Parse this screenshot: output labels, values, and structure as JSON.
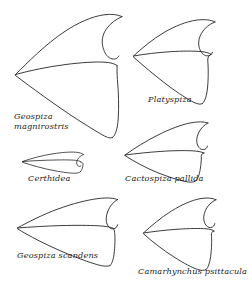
{
  "figure": {
    "kind": "scientific-line-illustration",
    "background_color": "#ffffff",
    "line_color": "#26262b",
    "width": 249,
    "height": 288
  },
  "specimens": [
    {
      "id": "geospiza-magnirostris",
      "label": "Geospiza\nmagnirostris",
      "label_lines": [
        "Geospiza",
        "magnirostris"
      ],
      "label_x": 14,
      "label_y": 112,
      "position": "top-left",
      "beak_shape": "very deep, broad, blunt crushing bill"
    },
    {
      "id": "platyspiza",
      "label": "Platyspiza",
      "label_lines": [
        "Platyspiza"
      ],
      "label_x": 148,
      "label_y": 95,
      "position": "top-right",
      "beak_shape": "deep, short, parrot-like bill"
    },
    {
      "id": "certhidea",
      "label": "Certhidea",
      "label_lines": [
        "Certhidea"
      ],
      "label_x": 28,
      "label_y": 174,
      "position": "middle-left",
      "beak_shape": "slender, fine, warbler-like bill"
    },
    {
      "id": "cactospiza-pallida",
      "label": "Cactospiza pallida",
      "label_lines": [
        "Cactospiza pallida"
      ],
      "label_x": 125,
      "label_y": 174,
      "position": "middle-right",
      "beak_shape": "straight, moderately long probing bill"
    },
    {
      "id": "geospiza-scandens",
      "label": "Geospiza scandens",
      "label_lines": [
        "Geospiza scandens"
      ],
      "label_x": 17,
      "label_y": 251,
      "position": "bottom-left",
      "beak_shape": "long, pointed, decurved cactus bill"
    },
    {
      "id": "camarhynchus-psittacula",
      "label": "Camarhynchus psittacula",
      "label_lines": [
        "Camarhynchus psittacula"
      ],
      "label_x": 138,
      "label_y": 267,
      "position": "bottom-right",
      "beak_shape": "stout, deep, hooked parrot-like bill"
    }
  ]
}
